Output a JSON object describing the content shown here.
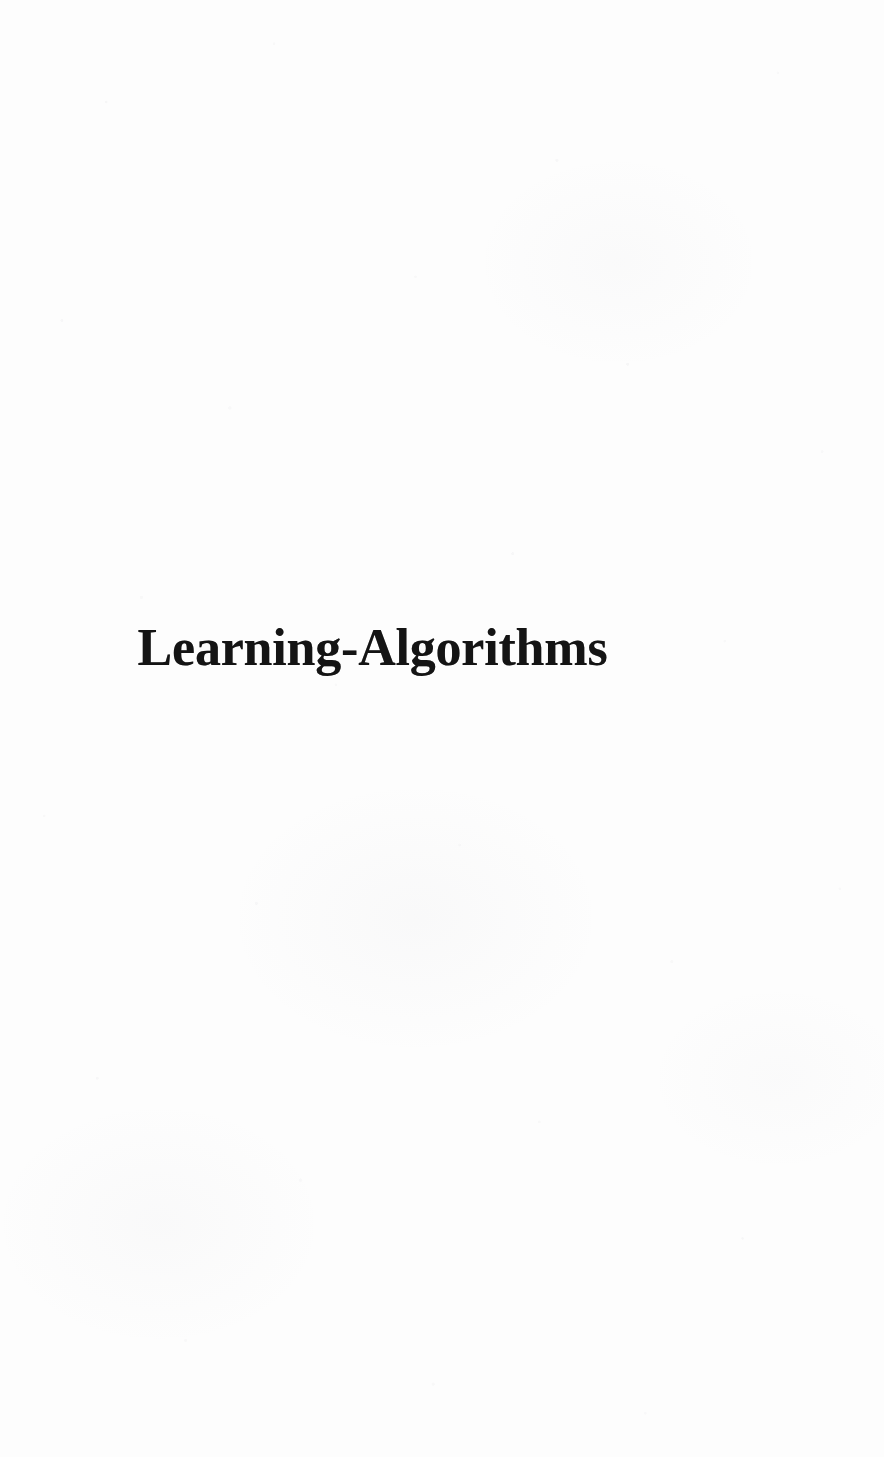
{
  "document": {
    "kind": "scanned-book-page",
    "page_type": "half-title-page",
    "background_color": "#fdfdfd",
    "ink_color": "#141414",
    "width": 884,
    "height": 1457
  },
  "title": {
    "text": "Learning-Algorithms"
  },
  "body": {
    "blocks": []
  }
}
